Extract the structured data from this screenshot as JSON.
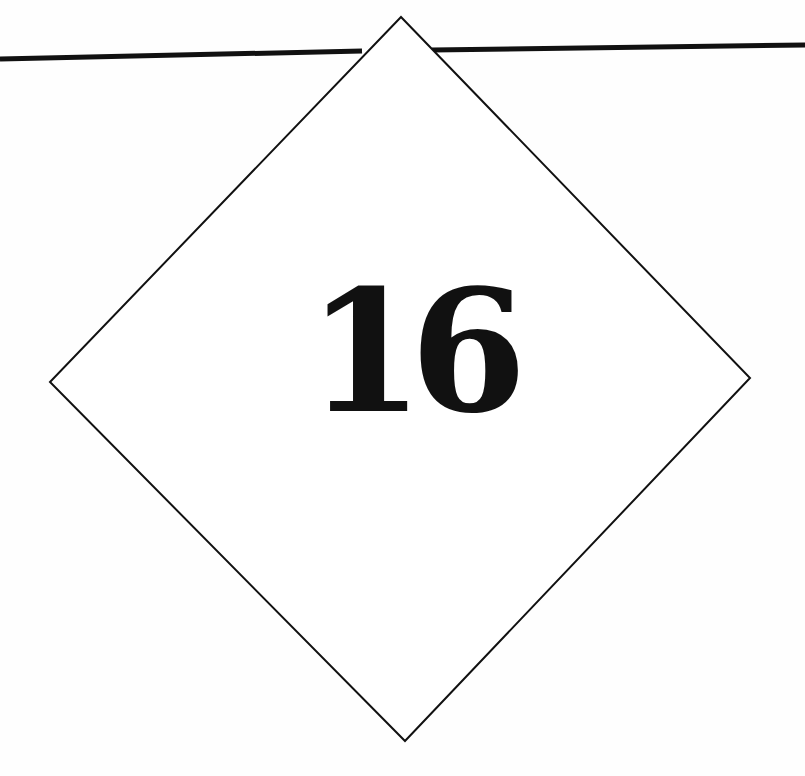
{
  "page": {
    "chapter_number": "16",
    "colors": {
      "background": "#fefefe",
      "ink": "#111111"
    },
    "diamond": {
      "top": [
        401,
        17
      ],
      "right": [
        750,
        378
      ],
      "bottom": [
        405,
        741
      ],
      "left": [
        50,
        382
      ]
    },
    "rule": {
      "left_start": [
        0,
        59
      ],
      "left_end": [
        362,
        51
      ],
      "right_start": [
        432,
        50
      ],
      "right_end": [
        805,
        45
      ]
    }
  }
}
